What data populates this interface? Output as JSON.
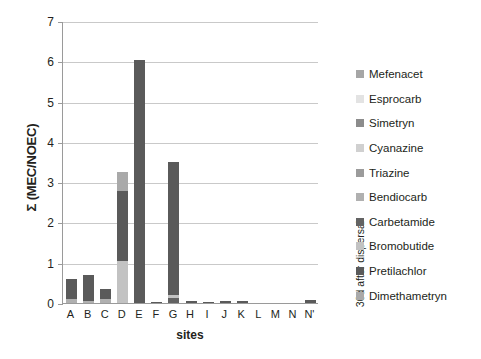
{
  "chart_data": {
    "type": "bar",
    "stacked": true,
    "title": "",
    "xlabel": "sites",
    "ylabel": "Σ (MEC/NOEC)",
    "ylim": [
      0,
      7
    ],
    "yticks": [
      0,
      1,
      2,
      3,
      4,
      5,
      6,
      7
    ],
    "grid": true,
    "legend_position": "right",
    "annotation": "30d after dispersal",
    "categories": [
      "A",
      "B",
      "C",
      "D",
      "E",
      "F",
      "G",
      "H",
      "I",
      "J",
      "K",
      "L",
      "M",
      "N",
      "N'"
    ],
    "series": [
      {
        "name": "Mefenacet",
        "color": "#a6a6a6",
        "values": [
          0.0,
          0.0,
          0.0,
          0.0,
          0.0,
          0.0,
          0.0,
          0.0,
          0.0,
          0.0,
          0.0,
          0.0,
          0.0,
          0.0,
          0.0
        ]
      },
      {
        "name": "Esprocarb",
        "color": "#e3e3e3",
        "values": [
          0.0,
          0.0,
          0.0,
          0.0,
          0.0,
          0.0,
          0.0,
          0.0,
          0.0,
          0.0,
          0.0,
          0.0,
          0.0,
          0.0,
          0.0
        ]
      },
      {
        "name": "Simetryn",
        "color": "#8c8c8c",
        "values": [
          0.0,
          0.0,
          0.0,
          0.0,
          0.0,
          0.0,
          0.0,
          0.0,
          0.0,
          0.0,
          0.0,
          0.0,
          0.0,
          0.0,
          0.0
        ]
      },
      {
        "name": "Cyanazine",
        "color": "#d0d0d0",
        "values": [
          0.0,
          0.0,
          0.0,
          0.0,
          0.0,
          0.0,
          0.0,
          0.0,
          0.0,
          0.0,
          0.0,
          0.0,
          0.0,
          0.0,
          0.0
        ]
      },
      {
        "name": "Triazine",
        "color": "#9b9b9b",
        "values": [
          0.0,
          0.0,
          0.0,
          0.0,
          0.0,
          0.0,
          0.0,
          0.0,
          0.0,
          0.0,
          0.0,
          0.0,
          0.0,
          0.0,
          0.0
        ]
      },
      {
        "name": "Bendiocarb",
        "color": "#b0b0b0",
        "values": [
          0.09,
          0.06,
          0.09,
          0.0,
          0.0,
          0.0,
          0.0,
          0.0,
          0.0,
          0.0,
          0.0,
          0.0,
          0.0,
          0.0,
          0.0
        ]
      },
      {
        "name": "Carbetamide",
        "color": "#636363",
        "values": [
          0.0,
          0.0,
          0.0,
          0.0,
          0.0,
          0.0,
          0.12,
          0.0,
          0.0,
          0.0,
          0.0,
          0.0,
          0.0,
          0.0,
          0.0
        ]
      },
      {
        "name": "Bromobutide",
        "color": "#c2c2c2",
        "values": [
          0.0,
          0.0,
          0.0,
          1.05,
          0.0,
          0.0,
          0.09,
          0.0,
          0.0,
          0.0,
          0.0,
          0.0,
          0.0,
          0.0,
          0.0
        ]
      },
      {
        "name": "Pretilachlor",
        "color": "#5a5a5a",
        "values": [
          0.51,
          0.64,
          0.26,
          1.72,
          6.02,
          0.03,
          3.29,
          0.05,
          0.03,
          0.06,
          0.06,
          0.0,
          0.0,
          0.0,
          0.07
        ]
      },
      {
        "name": "Dimethametryn",
        "color": "#a9a9a9",
        "values": [
          0.0,
          0.0,
          0.0,
          0.48,
          0.0,
          0.0,
          0.0,
          0.0,
          0.0,
          0.0,
          0.0,
          0.0,
          0.0,
          0.0,
          0.0
        ]
      }
    ],
    "totals": [
      0.6,
      0.7,
      0.35,
      3.25,
      6.02,
      0.03,
      3.5,
      0.05,
      0.03,
      0.06,
      0.06,
      0.0,
      0.0,
      0.0,
      0.07
    ]
  },
  "axis": {
    "y_title": "Σ (MEC/NOEC)",
    "x_title": "sites"
  },
  "annotation": {
    "right_label": "30d after dispersal"
  }
}
